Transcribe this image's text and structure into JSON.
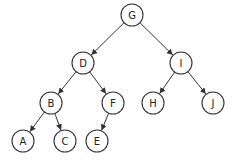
{
  "diagram": {
    "type": "binary-tree",
    "edge_color": "#333333",
    "node_stroke": "#333333",
    "node_fill": "#ffffff",
    "node_radius": 11,
    "nodes": [
      {
        "id": "G",
        "label": "G",
        "x": 132,
        "y": 15
      },
      {
        "id": "D",
        "label": "D",
        "x": 83,
        "y": 63
      },
      {
        "id": "I",
        "label": "I",
        "x": 181,
        "y": 63
      },
      {
        "id": "B",
        "label": "B",
        "x": 51,
        "y": 103
      },
      {
        "id": "F",
        "label": "F",
        "x": 113,
        "y": 103
      },
      {
        "id": "H",
        "label": "H",
        "x": 153,
        "y": 103
      },
      {
        "id": "J",
        "label": "J",
        "x": 213,
        "y": 103
      },
      {
        "id": "A",
        "label": "A",
        "x": 23,
        "y": 141
      },
      {
        "id": "C",
        "label": "C",
        "x": 65,
        "y": 141
      },
      {
        "id": "E",
        "label": "E",
        "x": 97,
        "y": 141
      }
    ],
    "edges": [
      {
        "from": "G",
        "to": "D"
      },
      {
        "from": "G",
        "to": "I"
      },
      {
        "from": "D",
        "to": "B"
      },
      {
        "from": "D",
        "to": "F"
      },
      {
        "from": "I",
        "to": "H"
      },
      {
        "from": "I",
        "to": "J"
      },
      {
        "from": "B",
        "to": "A"
      },
      {
        "from": "B",
        "to": "C"
      },
      {
        "from": "F",
        "to": "E"
      }
    ]
  }
}
